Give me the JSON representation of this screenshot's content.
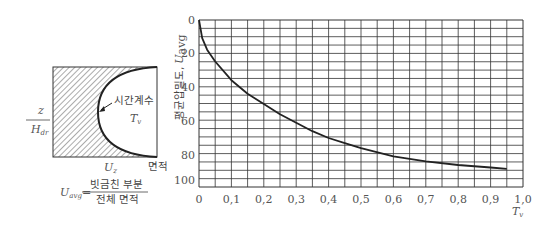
{
  "diagram": {
    "z_label": "z",
    "h_label": "H",
    "h_sub": "dr",
    "time_factor_label": "시간계수",
    "tv_label": "T",
    "tv_sub": "v",
    "uz_label": "U",
    "uz_sub": "z",
    "area_label": "면적",
    "formula_lhs": "U",
    "formula_lhs_sub": "avg",
    "formula_eq": "=",
    "formula_num": "빗금친 부분",
    "formula_den": "전체 면적"
  },
  "chart_data": {
    "type": "line",
    "title": "",
    "xlabel": "T_v",
    "ylabel": "평균압밀도, U_avg",
    "x_ticks": [
      "0",
      "0,1",
      "0,2",
      "0,3",
      "0,4",
      "0,5",
      "0,6",
      "0,7",
      "0,8",
      "0,9",
      "1,0"
    ],
    "y_ticks": [
      "0",
      "20",
      "40",
      "60",
      "80",
      "100"
    ],
    "xlim": [
      0,
      1.0
    ],
    "ylim": [
      0,
      100
    ],
    "y_inverted": true,
    "grid": true,
    "series": [
      {
        "name": "U_avg vs T_v",
        "x": [
          0,
          0.01,
          0.025,
          0.05,
          0.1,
          0.15,
          0.2,
          0.25,
          0.3,
          0.35,
          0.4,
          0.45,
          0.5,
          0.6,
          0.7,
          0.8,
          0.9,
          0.95
        ],
        "y": [
          0,
          11,
          18,
          25,
          36,
          44,
          50,
          56,
          61,
          66,
          70,
          73,
          76,
          81,
          85,
          88,
          90,
          91
        ]
      }
    ]
  },
  "labels": {
    "ylabel_ko": "평균압밀도,",
    "ylabel_sym": "U",
    "ylabel_sub": "avg",
    "xlabel_sym": "T",
    "xlabel_sub": "v"
  }
}
